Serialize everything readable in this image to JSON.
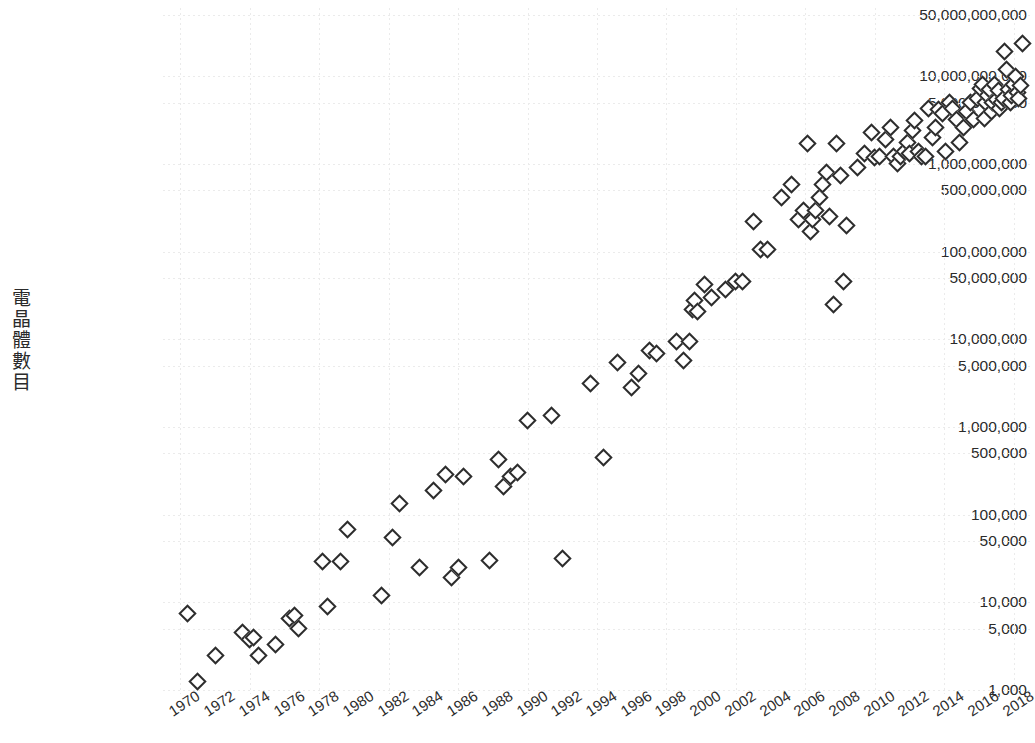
{
  "chart_data": {
    "type": "scatter",
    "title": "",
    "subtitle": "",
    "xlabel": "",
    "ylabel": "電晶體數目",
    "ylabel_chars": [
      "電",
      "晶",
      "體",
      "數",
      "目"
    ],
    "xlim": [
      1969,
      2019
    ],
    "ylim": [
      900,
      60000000000
    ],
    "yscale": "log",
    "xscale": "linear",
    "grid": true,
    "legend": false,
    "legend_position": "none",
    "background_color": "#ffffff",
    "marker_color": "#2d2d2d",
    "marker_shape": "diamond",
    "grid_color": "#ebebeb",
    "ytick_labels": [
      "50,000,000,000",
      "10,000,000,000",
      "5,000,000,000",
      "1,000,000,000",
      "500,000,000",
      "100,000,000",
      "50,000,000",
      "10,000,000",
      "5,000,000",
      "1,000,000",
      "500,000",
      "100,000",
      "50,000",
      "10,000",
      "5,000",
      "1,000"
    ],
    "ytick_values": [
      50000000000,
      10000000000,
      5000000000,
      1000000000,
      500000000,
      100000000,
      50000000,
      10000000,
      5000000,
      1000000,
      500000,
      100000,
      50000,
      10000,
      5000,
      1000
    ],
    "xtick_labels": [
      "1970",
      "1972",
      "1974",
      "1976",
      "1978",
      "1980",
      "1982",
      "1984",
      "1986",
      "1988",
      "1990",
      "1992",
      "1994",
      "1996",
      "1998",
      "2000",
      "2002",
      "2004",
      "2006",
      "2008",
      "2010",
      "2012",
      "2014",
      "2016",
      "2018"
    ],
    "xtick_values": [
      1970,
      1972,
      1974,
      1976,
      1978,
      1980,
      1982,
      1984,
      1986,
      1988,
      1990,
      1992,
      1994,
      1996,
      1998,
      2000,
      2002,
      2004,
      2006,
      2008,
      2010,
      2012,
      2014,
      2016,
      2018
    ],
    "x": [
      1970.4,
      1971.0,
      1972.0,
      1973.6,
      1974.0,
      1974.2,
      1974.5,
      1975.5,
      1976.3,
      1976.6,
      1976.8,
      1978.2,
      1978.5,
      1979.2,
      1979.6,
      1981.6,
      1982.2,
      1982.6,
      1983.8,
      1984.6,
      1985.3,
      1985.6,
      1986.0,
      1986.3,
      1987.8,
      1988.3,
      1988.6,
      1989.0,
      1989.4,
      1990.0,
      1991.4,
      1992.0,
      1993.6,
      1994.4,
      1995.2,
      1996.0,
      1996.4,
      1997.0,
      1997.4,
      1998.6,
      1999.0,
      1999.3,
      1999.5,
      1999.6,
      1999.8,
      2000.2,
      2000.6,
      2001.4,
      2002.0,
      2002.4,
      2003.0,
      2003.4,
      2003.8,
      2004.6,
      2005.2,
      2005.6,
      2005.9,
      2006.1,
      2006.3,
      2006.4,
      2006.6,
      2006.8,
      2007.0,
      2007.2,
      2007.4,
      2007.6,
      2007.8,
      2008.0,
      2008.2,
      2008.4,
      2009.0,
      2009.4,
      2009.8,
      2010.0,
      2010.3,
      2010.6,
      2010.9,
      2011.1,
      2011.3,
      2011.5,
      2011.7,
      2011.9,
      2012.0,
      2012.2,
      2012.3,
      2012.5,
      2012.7,
      2012.9,
      2013.1,
      2013.3,
      2013.5,
      2013.7,
      2013.9,
      2014.1,
      2014.3,
      2014.5,
      2014.7,
      2014.9,
      2015.1,
      2015.3,
      2015.5,
      2015.7,
      2015.9,
      2016.1,
      2016.2,
      2016.3,
      2016.4,
      2016.5,
      2016.6,
      2016.7,
      2016.8,
      2016.9,
      2017.0,
      2017.1,
      2017.2,
      2017.3,
      2017.4,
      2017.5,
      2017.6,
      2017.7,
      2017.8,
      2017.9,
      2018.0,
      2018.1,
      2018.2,
      2018.3,
      2018.4,
      2018.5,
      2018.6
    ],
    "y": [
      7500,
      1250,
      2500,
      4500,
      3800,
      4000,
      2500,
      3300,
      6500,
      7000,
      5000,
      29000,
      9000,
      29000,
      68000,
      12000,
      55000,
      134000,
      25000,
      190000,
      290000,
      19000,
      25000,
      275000,
      30000,
      430000,
      210000,
      275000,
      300000,
      1200000,
      1350000,
      32000,
      3100000,
      450000,
      5500000,
      2800000,
      4100000,
      7500000,
      6800000,
      9500000,
      5800000,
      9500000,
      22000000,
      28000000,
      21000000,
      42000000,
      30000000,
      37000000,
      45000000,
      45000000,
      220000000,
      105000000,
      105000000,
      410000000,
      580000000,
      230000000,
      291000000,
      1700000000,
      169000000,
      230000000,
      291000000,
      410000000,
      582000000,
      789000000,
      250000000,
      25000000,
      1700000000,
      731000000,
      45000000,
      200000000,
      904000000,
      1300000000,
      2300000000,
      1170000000,
      1200000000,
      1900000000,
      2600000000,
      1200000000,
      1000000000,
      1200000000,
      1400000000,
      1750000000,
      1300000000,
      2400000000,
      3100000000,
      1400000000,
      1200000000,
      1200000000,
      4310000000,
      2000000000,
      2600000000,
      4200000000,
      3800000000,
      1400000000,
      5000000000,
      4300000000,
      3200000000,
      1750000000,
      2600000000,
      4000000000,
      5000000000,
      3200000000,
      5500000000,
      7200000000,
      8000000000,
      3300000000,
      5000000000,
      6000000000,
      7000000000,
      4000000000,
      5000000000,
      8000000000,
      5400000000,
      6900000000,
      4300000000,
      5000000000,
      5600000000,
      19200000000,
      12000000000,
      7000000000,
      5000000000,
      6000000000,
      8000000000,
      10000000000,
      6500000000,
      5500000000,
      7800000000,
      23600000000
    ]
  },
  "caption": {
    "text": ""
  }
}
